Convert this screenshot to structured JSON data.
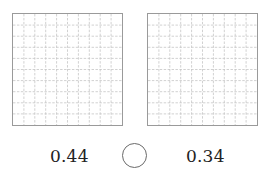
{
  "grids": [
    {
      "id": "left",
      "rows": 10,
      "cols": 10,
      "shaded_cells": 0,
      "border_color": "#9a9a9a",
      "line_color": "#c4c4c4"
    },
    {
      "id": "right",
      "rows": 10,
      "cols": 10,
      "shaded_cells": 0,
      "border_color": "#9a9a9a",
      "line_color": "#c4c4c4"
    }
  ],
  "comparison": {
    "left_value": "0.44",
    "right_value": "0.34",
    "answer_circle": "",
    "icon": "empty-circle-icon"
  }
}
